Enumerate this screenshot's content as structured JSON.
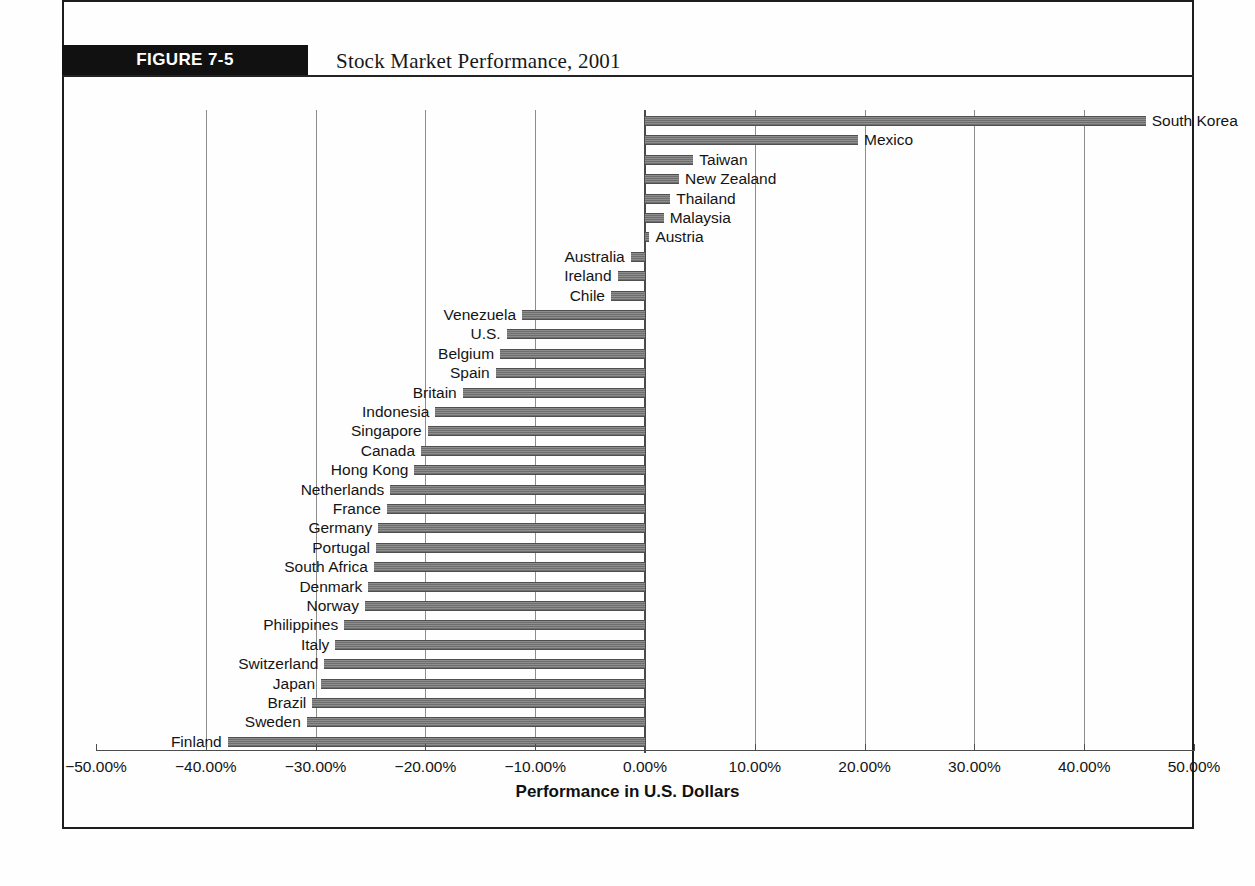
{
  "figure": {
    "badge": "FIGURE 7-5",
    "title": "Stock Market Performance, 2001",
    "badge_color": "#111111"
  },
  "axis": {
    "x_title": "Performance in U.S. Dollars",
    "ticks": [
      "−50.00%",
      "−40.00%",
      "−30.00%",
      "−20.00%",
      "−10.00%",
      "0.00%",
      "10.00%",
      "20.00%",
      "30.00%",
      "40.00%",
      "50.00%"
    ],
    "tick_values": [
      -50,
      -40,
      -30,
      -20,
      -10,
      0,
      10,
      20,
      30,
      40,
      50
    ]
  },
  "chart_data": {
    "type": "bar",
    "orientation": "horizontal",
    "title": "Stock Market Performance, 2001",
    "subtitle": "",
    "xlabel": "Performance in U.S. Dollars",
    "ylabel": "",
    "xlim": [
      -50,
      50
    ],
    "grid": true,
    "legend": "none",
    "xtick_labels": [
      "−50.00%",
      "−40.00%",
      "−30.00%",
      "−20.00%",
      "−10.00%",
      "0.00%",
      "10.00%",
      "20.00%",
      "30.00%",
      "40.00%",
      "50.00%"
    ],
    "xtick_values": [
      -50,
      -40,
      -30,
      -20,
      -10,
      0,
      10,
      20,
      30,
      40,
      50
    ],
    "unit": "percent",
    "categories": [
      "South Korea",
      "Mexico",
      "Taiwan",
      "New Zealand",
      "Thailand",
      "Malaysia",
      "Austria",
      "Australia",
      "Ireland",
      "Chile",
      "Venezuela",
      "U.S.",
      "Belgium",
      "Spain",
      "Britain",
      "Indonesia",
      "Singapore",
      "Canada",
      "Hong Kong",
      "Netherlands",
      "France",
      "Germany",
      "Portugal",
      "South Africa",
      "Denmark",
      "Norway",
      "Philippines",
      "Italy",
      "Switzerland",
      "Japan",
      "Brazil",
      "Sweden",
      "Finland"
    ],
    "values": [
      45.6,
      19.4,
      4.4,
      3.1,
      2.3,
      1.7,
      0.4,
      -1.3,
      -2.5,
      -3.1,
      -11.2,
      -12.6,
      -13.2,
      -13.6,
      -16.6,
      -19.1,
      -19.8,
      -20.4,
      -21.0,
      -23.2,
      -23.5,
      -24.3,
      -24.5,
      -24.7,
      -25.2,
      -25.5,
      -27.4,
      -28.2,
      -29.2,
      -29.5,
      -30.3,
      -30.8,
      -38.0
    ]
  }
}
